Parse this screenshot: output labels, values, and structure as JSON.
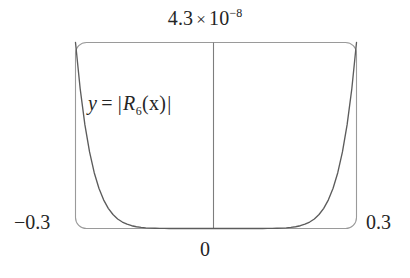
{
  "figure": {
    "background_color": "#ffffff",
    "frame_color": "#9a9a9a",
    "curve_color": "#5c5c5c",
    "axis_color": "#7d7d7d",
    "text_color": "#252525"
  },
  "labels": {
    "top_value_mantissa": "4.3",
    "top_value_times": "×",
    "top_value_base": "10",
    "top_value_exponent": "−8",
    "x_min": "−0.3",
    "x_max": "0.3",
    "x_origin": "0",
    "equation_y": "y",
    "equation_equals": "=",
    "equation_bar_open": "|",
    "equation_R": "R",
    "equation_subscript": "6",
    "equation_arg": "(x)",
    "equation_bar_close": "|"
  },
  "chart_data": {
    "type": "line",
    "title": "",
    "subtitle": "",
    "xlabel": "",
    "ylabel": "",
    "annotations": [
      {
        "text": "y = |R_6(x)|",
        "x": -0.18,
        "y": 2.9e-08
      },
      {
        "text": "4.3 × 10^-8",
        "position": "top-center",
        "meaning": "y-axis maximum value"
      }
    ],
    "xlim": [
      -0.3,
      0.3
    ],
    "ylim": [
      0,
      4.3e-08
    ],
    "x_ticks": [
      -0.3,
      0,
      0.3
    ],
    "x_tick_labels": [
      "−0.3",
      "0",
      "0.3"
    ],
    "y_ticks": [
      4.3e-08
    ],
    "y_tick_labels": [
      "4.3 × 10−8"
    ],
    "grid": false,
    "legend": false,
    "frame": "rounded-rectangle",
    "vertical_axis_at_x": 0,
    "series": [
      {
        "name": "y = |R6(x)|",
        "color": "#5c5c5c",
        "x": [
          -0.3,
          -0.29,
          -0.28,
          -0.27,
          -0.26,
          -0.25,
          -0.24,
          -0.23,
          -0.22,
          -0.21,
          -0.2,
          -0.19,
          -0.18,
          -0.17,
          -0.16,
          -0.15,
          -0.14,
          -0.13,
          -0.12,
          -0.11,
          -0.1,
          -0.09,
          -0.08,
          -0.07,
          -0.06,
          -0.05,
          -0.04,
          -0.03,
          -0.02,
          -0.01,
          0,
          0.01,
          0.02,
          0.03,
          0.04,
          0.05,
          0.06,
          0.07,
          0.08,
          0.09,
          0.1,
          0.11,
          0.12,
          0.13,
          0.14,
          0.15,
          0.16,
          0.17,
          0.18,
          0.19,
          0.2,
          0.21,
          0.22,
          0.23,
          0.24,
          0.25,
          0.26,
          0.27,
          0.28,
          0.29,
          0.3
        ],
        "y": [
          4.3e-08,
          3.23e-08,
          2.4e-08,
          1.77e-08,
          1.29e-08,
          9.3e-09,
          6.63e-09,
          4.66e-09,
          3.23e-09,
          2.21e-09,
          1.49e-09,
          9.86e-10,
          6.4e-10,
          4.07e-10,
          2.53e-10,
          1.53e-10,
          8.98e-11,
          5.1e-11,
          2.79e-11,
          1.47e-11,
          7.37e-12,
          3.5e-12,
          1.56e-12,
          6.46e-13,
          2.43e-13,
          8.13e-14,
          2.33e-14,
          5.46e-15,
          9.55e-16,
          1e-16,
          0,
          1e-16,
          9.55e-16,
          5.46e-15,
          2.33e-14,
          8.13e-14,
          2.43e-13,
          6.46e-13,
          1.56e-12,
          3.5e-12,
          7.37e-12,
          1.47e-11,
          2.79e-11,
          5.1e-11,
          8.98e-11,
          1.53e-10,
          2.53e-10,
          4.07e-10,
          6.4e-10,
          9.86e-10,
          1.49e-09,
          2.21e-09,
          3.23e-09,
          4.66e-09,
          6.63e-09,
          9.3e-09,
          1.29e-08,
          1.77e-08,
          2.4e-08,
          3.23e-08,
          4.3e-08
        ]
      }
    ]
  }
}
